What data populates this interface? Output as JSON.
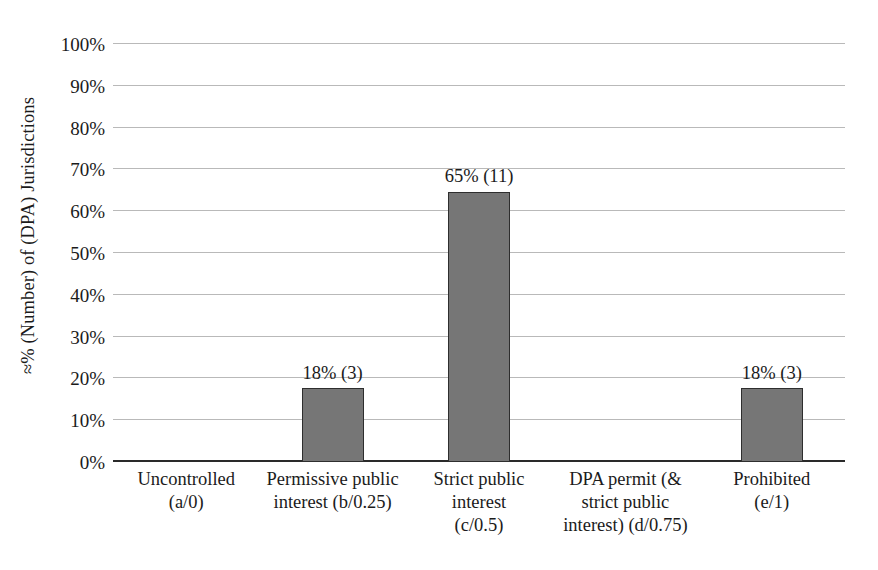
{
  "chart_data": {
    "type": "bar",
    "title": "",
    "subtitle": "",
    "xlabel": "",
    "ylabel": "≈% (Number) of (DPA) Jurisdictions",
    "ylim": [
      0,
      100
    ],
    "grid": true,
    "legend": false,
    "legend_position": "none",
    "bar_color": "#767676",
    "bar_border_color": "#2e2e2e",
    "gridline_color": "#b9b9b9",
    "axis_color": "#2a2a2a",
    "y_tick_labels": [
      "100%",
      "90%",
      "80%",
      "70%",
      "60%",
      "50%",
      "40%",
      "30%",
      "20%",
      "10%",
      "0%"
    ],
    "y_tick_values": [
      100,
      90,
      80,
      70,
      60,
      50,
      40,
      30,
      20,
      10,
      0
    ],
    "categories": [
      "Uncontrolled (a/0)",
      "Permissive public interest (b/0.25)",
      "Strict public interest (c/0.5)",
      "DPA permit (& strict public interest) (d/0.75)",
      "Prohibited (e/1)"
    ],
    "category_lines": [
      [
        "Uncontrolled",
        "(a/0)"
      ],
      [
        "Permissive public",
        "interest (b/0.25)"
      ],
      [
        "Strict public",
        "interest",
        "(c/0.5)"
      ],
      [
        "DPA permit (&",
        "strict public",
        "interest) (d/0.75)"
      ],
      [
        "Prohibited",
        "(e/1)"
      ]
    ],
    "values": [
      0,
      17.6,
      64.7,
      0,
      17.6
    ],
    "counts": [
      0,
      3,
      11,
      0,
      3
    ],
    "data_labels": [
      "",
      "18% (3)",
      "65% (11)",
      "",
      "18% (3)"
    ]
  }
}
